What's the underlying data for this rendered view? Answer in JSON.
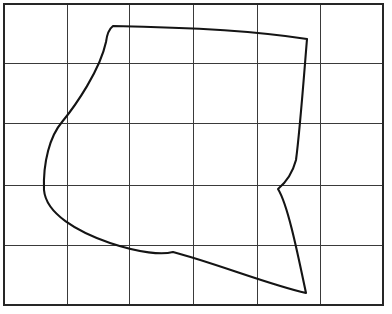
{
  "figure": {
    "canvas": {
      "width": 392,
      "height": 314,
      "background": "#ffffff"
    },
    "grid": {
      "columns": 6,
      "rows": 5,
      "x_lines": [
        4,
        67,
        129,
        193,
        257,
        320,
        383
      ],
      "y_lines": [
        4,
        63,
        123,
        185,
        245,
        305
      ],
      "line_color": "#3a3a3a",
      "border_color": "#262626",
      "line_width": 1,
      "border_width": 1.4,
      "cell_width": 63,
      "cell_height": 60
    },
    "shape": {
      "name": "closed-outline-curve",
      "stroke_color": "#141414",
      "stroke_width": 2.1,
      "fill": "none",
      "closed": true,
      "vertices": [
        {
          "label": "top-left-corner",
          "x": 113,
          "y": 26
        },
        {
          "label": "top-right-corner",
          "x": 307,
          "y": 39
        },
        {
          "label": "right-concave-vertex",
          "x": 278,
          "y": 189
        },
        {
          "label": "bottom-right-corner",
          "x": 306,
          "y": 293
        },
        {
          "label": "bottom-notch-peak",
          "x": 173,
          "y": 252
        },
        {
          "label": "left-lower-bend",
          "x": 110,
          "y": 243
        },
        {
          "label": "left-extreme-bulge",
          "x": 44,
          "y": 190
        },
        {
          "label": "left-upper-inflection",
          "x": 62,
          "y": 122
        }
      ],
      "path": "M 113 26 C 170 27 250 30 307 39 C 304 75 300 130 296 160 C 292 175 284 184 278 189 C 288 205 298 255 306 293 C 270 285 215 263 173 252 C 162 255 140 253 110 243 C 78 232 46 214 44 190 C 43 162 50 136 62 122 C 76 105 100 70 106 42 C 107 34 109 29 113 26 Z"
    }
  }
}
